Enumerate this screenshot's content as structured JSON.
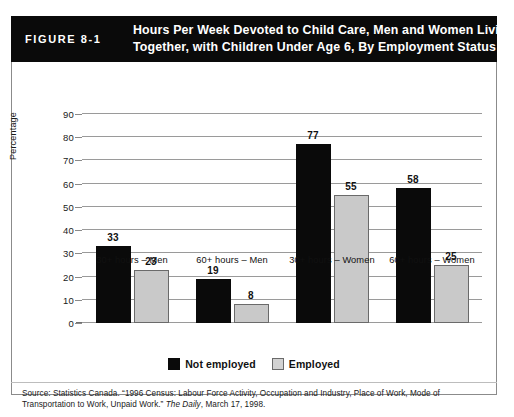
{
  "figure": {
    "number_label": "FIGURE 8-1",
    "title_line1": "Hours Per Week Devoted to Child Care, Men and Women Living",
    "title_line2": "Together, with Children Under Age 6, By Employment Status"
  },
  "source": {
    "line1": "Source: Statistics Canada. “1996 Census: Labour Force Activity, Occupation and Industry, Place of Work, Mode of Transportation",
    "line2_pre": "to Work, Unpaid Work.” ",
    "line2_italic": "The Daily",
    "line2_post": ", March 17, 1998."
  },
  "colors": {
    "header_band": "#0a0a0a",
    "not_employed_bar": "#0a0a0a",
    "employed_bar": "#c9c9c9",
    "employed_bar_outline": "#6a6a6a",
    "gridline": "#9a9a9a",
    "frame_border": "#8b8b8b"
  },
  "chart_data": {
    "type": "bar",
    "title": "Hours Per Week Devoted to Child Care, Men and Women Living Together, with Children Under Age 6, By Employment Status",
    "xlabel": "",
    "ylabel": "Percentage",
    "ylim": [
      0,
      90
    ],
    "yticks": [
      0,
      10,
      20,
      30,
      40,
      50,
      60,
      70,
      80,
      90
    ],
    "ytick_labels": [
      "0",
      "10",
      "20",
      "30",
      "40",
      "50",
      "60",
      "70",
      "80",
      "90"
    ],
    "grid": true,
    "legend_position": "bottom-center",
    "categories": [
      "30+ hours – Men",
      "60+ hours – Men",
      "30+ hours – Women",
      "60+ hours – Women"
    ],
    "series": [
      {
        "name": "Not employed",
        "color": "#0a0a0a",
        "values": [
          33,
          19,
          77,
          58
        ],
        "value_labels": [
          "33",
          "19",
          "77",
          "58"
        ]
      },
      {
        "name": "Employed",
        "color": "#c9c9c9",
        "values": [
          23,
          8,
          55,
          25
        ],
        "value_labels": [
          "23",
          "8",
          "55",
          "25"
        ]
      }
    ]
  }
}
